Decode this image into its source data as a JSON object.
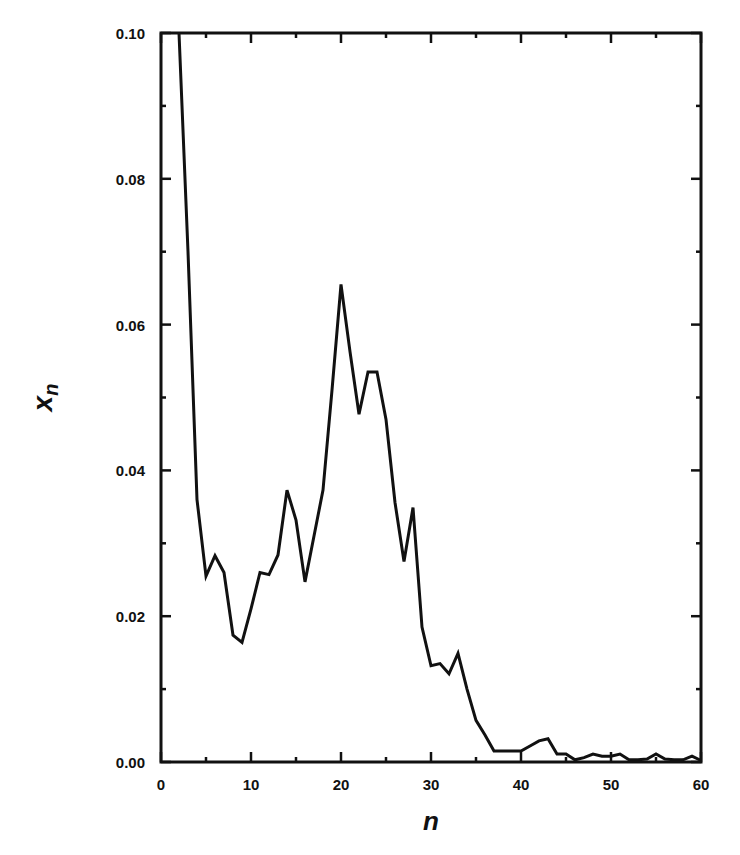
{
  "chart_data": {
    "type": "line",
    "title": "",
    "xlabel": "n",
    "ylabel": "x_n",
    "ylabel_main": "x",
    "ylabel_sub": "n",
    "xlim": [
      0,
      60
    ],
    "ylim": [
      0.0,
      0.1
    ],
    "grid": false,
    "legend": null,
    "x_ticks": [
      0,
      10,
      20,
      30,
      40,
      50,
      60
    ],
    "x_tick_labels": [
      "0",
      "10",
      "20",
      "30",
      "40",
      "50",
      "60"
    ],
    "x_minor_ticks": [
      5,
      15,
      25,
      35,
      45,
      55
    ],
    "y_ticks": [
      0.0,
      0.02,
      0.04,
      0.06,
      0.08,
      0.1
    ],
    "y_tick_labels": [
      "0.00",
      "0.02",
      "0.04",
      "0.06",
      "0.08",
      "0.10"
    ],
    "y_minor_ticks": [
      0.01,
      0.03,
      0.05,
      0.07,
      0.09
    ],
    "series": [
      {
        "name": "x_n",
        "color": "#111111",
        "x": [
          2,
          3,
          4,
          5,
          6,
          7,
          8,
          9,
          10,
          11,
          12,
          13,
          14,
          15,
          16,
          17,
          18,
          19,
          20,
          21,
          22,
          23,
          24,
          25,
          26,
          27,
          28,
          29,
          30,
          31,
          32,
          33,
          34,
          35,
          36,
          37,
          38,
          39,
          40,
          41,
          42,
          43,
          44,
          45,
          46,
          47,
          48,
          49,
          50,
          51,
          52,
          53,
          54,
          55,
          56,
          57,
          58,
          59,
          60
        ],
        "values": [
          0.1,
          0.07,
          0.036,
          0.0255,
          0.0283,
          0.026,
          0.0174,
          0.0164,
          0.021,
          0.026,
          0.0257,
          0.0284,
          0.0373,
          0.0332,
          0.0247,
          0.031,
          0.0373,
          0.051,
          0.0655,
          0.0563,
          0.0477,
          0.0535,
          0.0535,
          0.047,
          0.0356,
          0.0275,
          0.0349,
          0.0185,
          0.0132,
          0.0135,
          0.0121,
          0.0149,
          0.01,
          0.0057,
          0.0037,
          0.0015,
          0.0015,
          0.0015,
          0.0015,
          0.0022,
          0.0029,
          0.0032,
          0.0011,
          0.0011,
          0.0003,
          0.0006,
          0.0011,
          0.0008,
          0.0008,
          0.0011,
          0.0003,
          0.0003,
          0.0004,
          0.0011,
          0.0004,
          0.0003,
          0.0003,
          0.0008,
          0.0002
        ]
      }
    ]
  }
}
